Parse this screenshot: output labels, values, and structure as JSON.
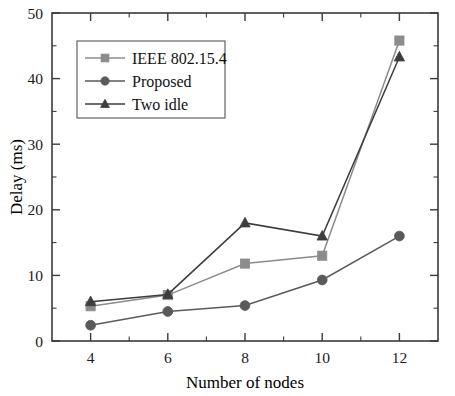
{
  "chart_data": {
    "type": "line",
    "title": "",
    "xlabel": "Number of nodes",
    "ylabel": "Delay (ms)",
    "categories": [
      4,
      6,
      8,
      10,
      12
    ],
    "x": [
      4,
      6,
      8,
      10,
      12
    ],
    "xlim": [
      3,
      13
    ],
    "ylim": [
      0,
      50
    ],
    "xticks": [
      "4",
      "6",
      "8",
      "10",
      "12"
    ],
    "yticks": [
      "0",
      "10",
      "20",
      "30",
      "40",
      "50"
    ],
    "x_minor_step": 1,
    "y_minor_step": 5,
    "grid": false,
    "legend_position": "upper-left",
    "series": [
      {
        "name": "IEEE 802.15.4",
        "marker": "square",
        "color": "#8c8c8c",
        "values": [
          5.3,
          7.0,
          11.8,
          13.0,
          45.8
        ]
      },
      {
        "name": "Proposed",
        "marker": "circle",
        "color": "#5a5a5a",
        "values": [
          2.4,
          4.5,
          5.4,
          9.3,
          16.0
        ]
      },
      {
        "name": "Two idle",
        "marker": "triangle",
        "color": "#3d3d3d",
        "values": [
          6.0,
          7.1,
          18.0,
          16.0,
          43.3
        ]
      }
    ]
  },
  "axes": {
    "x_title": "Number of nodes",
    "y_title": "Delay (ms)"
  },
  "legend": {
    "entries": [
      {
        "label": "IEEE 802.15.4"
      },
      {
        "label": "Proposed"
      },
      {
        "label": "Two idle"
      }
    ]
  },
  "colors": {
    "axis": "#3a3a3a",
    "background": "#ffffff",
    "series_ieee": "#8c8c8c",
    "series_proposed": "#5a5a5a",
    "series_two_idle": "#3d3d3d"
  }
}
